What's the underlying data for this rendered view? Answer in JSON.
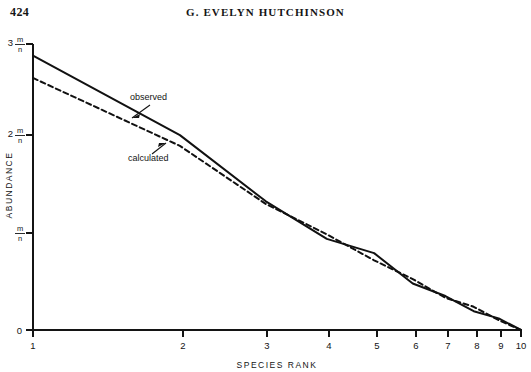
{
  "page": {
    "number": "424",
    "running_head": "G. EVELYN HUTCHINSON"
  },
  "chart_data": {
    "type": "line",
    "title": "",
    "xlabel": "SPECIES  RANK",
    "ylabel": "ABUNDANCE",
    "x": [
      1,
      2,
      3,
      4,
      5,
      6,
      7,
      8,
      9,
      10
    ],
    "x_tick_labels": [
      "1",
      "2",
      "3",
      "4",
      "5",
      "6",
      "7",
      "8",
      "9",
      "10"
    ],
    "x_scale": "logarithmic",
    "y_tick_labels": [
      "0",
      "m/n",
      "2 m/n",
      "3 m/n"
    ],
    "y_tick_values": [
      0,
      1,
      2,
      3
    ],
    "ylim": [
      0,
      3.2
    ],
    "grid": false,
    "legend": "inline-annotations",
    "series": [
      {
        "name": "observed",
        "style": "solid",
        "values": [
          3.07,
          2.18,
          1.44,
          1.02,
          0.86,
          0.52,
          0.38,
          0.21,
          0.13,
          0.0
        ]
      },
      {
        "name": "calculated",
        "style": "dashed",
        "values": [
          2.82,
          2.06,
          1.41,
          1.07,
          0.78,
          0.57,
          0.36,
          0.26,
          0.11,
          0.0
        ]
      }
    ],
    "annotations": [
      {
        "text": "observed",
        "target_series": "observed"
      },
      {
        "text": "calculated",
        "target_series": "calculated"
      }
    ]
  }
}
